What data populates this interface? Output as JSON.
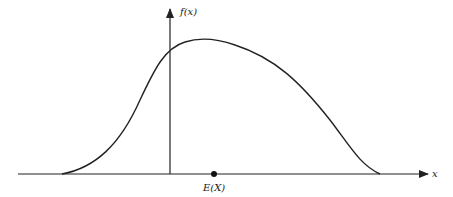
{
  "diagram": {
    "type": "probability density curve",
    "labels": {
      "y_axis": "f(x)",
      "x_axis": "x",
      "mean_marker": "E(X)"
    },
    "colors": {
      "stroke": "#222222",
      "background": "#ffffff"
    },
    "geometry": {
      "x_axis": {
        "x1": 18,
        "x2": 428,
        "y": 174
      },
      "y_axis": {
        "x": 170,
        "y1": 174,
        "y2": 8
      },
      "mean_point": {
        "x": 214,
        "y": 174
      },
      "curve_start_x": 62,
      "curve_peak": {
        "x": 198,
        "y": 39
      },
      "curve_end_x": 380
    }
  }
}
